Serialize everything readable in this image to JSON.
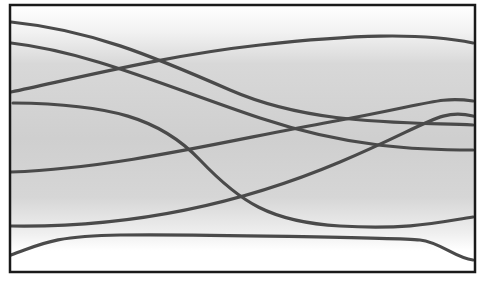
{
  "figure": {
    "frame": {
      "x": 10,
      "y": 5,
      "width": 465,
      "height": 267,
      "stroke": "#1a1a1a",
      "stroke_width": 2.5
    },
    "background_gradient": {
      "stops": [
        {
          "offset": "0%",
          "color": "#ffffff"
        },
        {
          "offset": "10%",
          "color": "#f2f2f2"
        },
        {
          "offset": "22%",
          "color": "#d8d8d8"
        },
        {
          "offset": "50%",
          "color": "#cfcfcf"
        },
        {
          "offset": "72%",
          "color": "#d6d6d6"
        },
        {
          "offset": "85%",
          "color": "#eeeeee"
        },
        {
          "offset": "92%",
          "color": "#ffffff"
        },
        {
          "offset": "100%",
          "color": "#ffffff"
        }
      ]
    },
    "curve_color": "#4a4a4a",
    "curve_width": 3.2,
    "curves": [
      {
        "name": "curve-a",
        "d": "M11,22 C90,30 150,55 230,90 S400,122 473,125"
      },
      {
        "name": "curve-b",
        "d": "M11,43 C90,52 170,88 260,118 S420,150 473,150"
      },
      {
        "name": "curve-c",
        "d": "M11,92 C90,75 170,55 260,45 S420,32 473,43"
      },
      {
        "name": "curve-d",
        "d": "M13,103 C110,104 160,118 200,160 S270,222 340,226 S440,222 473,217"
      },
      {
        "name": "curve-e",
        "d": "M11,172 C120,168 230,140 330,122 S440,96 473,101"
      },
      {
        "name": "curve-f",
        "d": "M11,226 C140,228 250,200 340,162 S440,108 473,116"
      },
      {
        "name": "curve-g",
        "d": "M11,255 C40,245 50,236 120,235 S400,238 420,240 S455,258 473,260"
      }
    ]
  }
}
